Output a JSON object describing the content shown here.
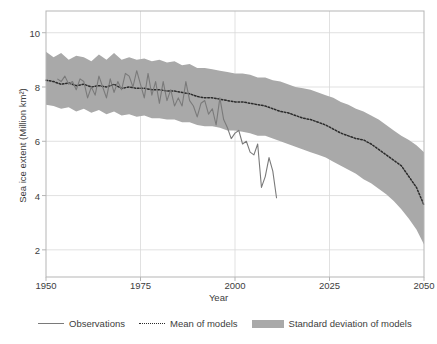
{
  "chart_data": {
    "type": "line",
    "title": "",
    "xlabel": "Year",
    "ylabel": "Sea ice extent (Million km²)",
    "xlim": [
      1950,
      2050
    ],
    "ylim": [
      1,
      10.8
    ],
    "grid": true,
    "legend_position": "below",
    "x_ticks": [
      "1950",
      "1975",
      "2000",
      "2025",
      "2050"
    ],
    "x_tick_values": [
      1950,
      1975,
      2000,
      2025,
      2050
    ],
    "y_ticks": [
      "2",
      "4",
      "6",
      "8",
      "10"
    ],
    "y_tick_values": [
      2,
      4,
      6,
      8,
      10
    ],
    "colors": {
      "observations": "#7a7a7a",
      "mean_of_models": "#2b2b2b",
      "std_band": "#a9a9a9",
      "grid": "#d9d9d9",
      "frame": "#b5b5b5",
      "text": "#3d3d3d"
    },
    "series": [
      {
        "name": "Observations",
        "style": "solid",
        "x": [
          1953,
          1954,
          1955,
          1956,
          1957,
          1958,
          1959,
          1960,
          1961,
          1962,
          1963,
          1964,
          1965,
          1966,
          1967,
          1968,
          1969,
          1970,
          1971,
          1972,
          1973,
          1974,
          1975,
          1976,
          1977,
          1978,
          1979,
          1980,
          1981,
          1982,
          1983,
          1984,
          1985,
          1986,
          1987,
          1988,
          1989,
          1990,
          1991,
          1992,
          1993,
          1994,
          1995,
          1996,
          1997,
          1998,
          1999,
          2000,
          2001,
          2002,
          2003,
          2004,
          2005,
          2006,
          2007,
          2008,
          2009,
          2010,
          2011
        ],
        "values": [
          8.3,
          8.2,
          8.4,
          8.1,
          8.2,
          7.9,
          8.3,
          8.2,
          7.6,
          8.0,
          7.7,
          8.4,
          8.0,
          7.6,
          8.3,
          7.8,
          8.2,
          7.9,
          8.5,
          8.4,
          8.0,
          8.6,
          8.1,
          7.6,
          8.5,
          7.7,
          8.2,
          7.4,
          8.2,
          7.5,
          7.9,
          7.3,
          7.6,
          7.3,
          8.2,
          7.5,
          7.3,
          6.9,
          7.4,
          7.5,
          7.0,
          7.2,
          6.6,
          7.6,
          6.8,
          6.5,
          6.1,
          6.3,
          6.4,
          5.9,
          6.0,
          5.6,
          5.5,
          5.9,
          4.3,
          4.7,
          5.4,
          4.9,
          3.9
        ]
      },
      {
        "name": "Mean of models",
        "style": "dotted",
        "x": [
          1950,
          1952,
          1954,
          1956,
          1958,
          1960,
          1962,
          1964,
          1966,
          1968,
          1970,
          1972,
          1974,
          1976,
          1978,
          1980,
          1982,
          1984,
          1986,
          1988,
          1990,
          1992,
          1994,
          1996,
          1998,
          2000,
          2002,
          2004,
          2006,
          2008,
          2010,
          2012,
          2014,
          2016,
          2018,
          2020,
          2022,
          2024,
          2026,
          2028,
          2030,
          2032,
          2034,
          2036,
          2038,
          2040,
          2042,
          2044,
          2046,
          2048,
          2050
        ],
        "values": [
          8.25,
          8.2,
          8.1,
          8.15,
          8.05,
          8.1,
          8.0,
          8.05,
          8.0,
          8.1,
          7.95,
          8.0,
          7.95,
          7.95,
          7.9,
          7.9,
          7.85,
          7.85,
          7.8,
          7.75,
          7.65,
          7.6,
          7.6,
          7.55,
          7.5,
          7.45,
          7.45,
          7.4,
          7.35,
          7.3,
          7.2,
          7.1,
          7.05,
          6.95,
          6.85,
          6.8,
          6.7,
          6.6,
          6.45,
          6.3,
          6.2,
          6.1,
          6.05,
          5.9,
          5.7,
          5.5,
          5.3,
          5.1,
          4.7,
          4.3,
          3.65
        ]
      }
    ],
    "band": {
      "name": "Standard deviation of models",
      "x": [
        1950,
        1952,
        1954,
        1956,
        1958,
        1960,
        1962,
        1964,
        1966,
        1968,
        1970,
        1972,
        1974,
        1976,
        1978,
        1980,
        1982,
        1984,
        1986,
        1988,
        1990,
        1992,
        1994,
        1996,
        1998,
        2000,
        2002,
        2004,
        2006,
        2008,
        2010,
        2012,
        2014,
        2016,
        2018,
        2020,
        2022,
        2024,
        2026,
        2028,
        2030,
        2032,
        2034,
        2036,
        2038,
        2040,
        2042,
        2044,
        2046,
        2048,
        2050
      ],
      "upper": [
        9.3,
        9.1,
        9.25,
        9.0,
        9.15,
        9.1,
        8.95,
        9.2,
        9.0,
        9.25,
        9.0,
        9.1,
        9.0,
        9.05,
        8.95,
        9.0,
        8.9,
        8.95,
        8.8,
        8.85,
        8.7,
        8.7,
        8.65,
        8.6,
        8.55,
        8.5,
        8.5,
        8.45,
        8.35,
        8.35,
        8.25,
        8.2,
        8.1,
        8.0,
        7.95,
        7.9,
        7.8,
        7.7,
        7.6,
        7.45,
        7.35,
        7.2,
        7.1,
        6.95,
        6.8,
        6.6,
        6.4,
        6.2,
        6.05,
        5.85,
        5.6
      ],
      "lower": [
        7.35,
        7.3,
        7.2,
        7.25,
        7.1,
        7.2,
        7.05,
        7.15,
        7.0,
        7.1,
        6.95,
        7.0,
        6.9,
        6.95,
        6.85,
        6.85,
        6.8,
        6.8,
        6.7,
        6.7,
        6.6,
        6.55,
        6.55,
        6.5,
        6.4,
        6.4,
        6.35,
        6.3,
        6.2,
        6.2,
        6.1,
        6.0,
        5.9,
        5.8,
        5.7,
        5.6,
        5.5,
        5.4,
        5.25,
        5.1,
        4.95,
        4.8,
        4.6,
        4.45,
        4.25,
        4.05,
        3.8,
        3.5,
        3.15,
        2.75,
        2.2
      ]
    }
  },
  "legend": {
    "items": [
      {
        "label": "Observations",
        "swatch": "solid-line"
      },
      {
        "label": "Mean of models",
        "swatch": "dotted-line"
      },
      {
        "label": "Standard deviation of models",
        "swatch": "filled-band"
      }
    ]
  }
}
